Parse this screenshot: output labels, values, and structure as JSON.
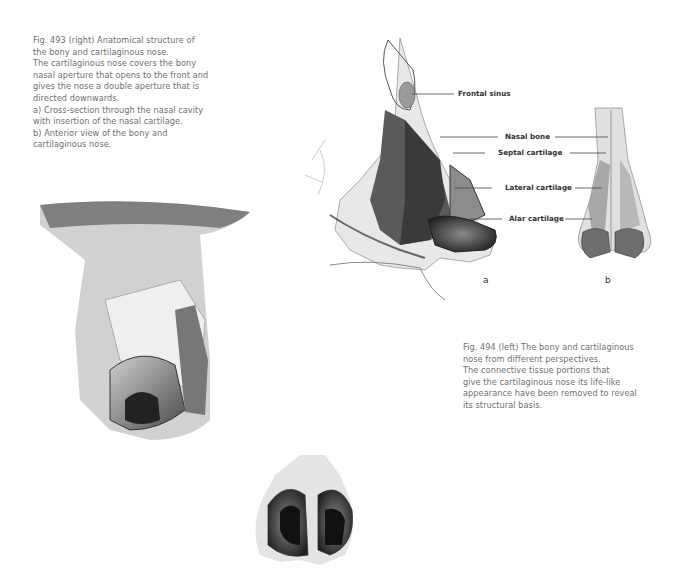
{
  "fig493": {
    "lines": [
      "Fig. 493 (right)  Anatomical structure of",
      "the bony and cartilaginous nose.",
      "The cartilaginous nose covers the bony",
      "nasal aperture that opens to the front and",
      "gives the nose a double aperture that is",
      "directed downwards.",
      "a)  Cross-section through the nasal cavity",
      "with insertion of the nasal cartilage.",
      "b)  Anterior view of the bony and",
      "cartilaginous nose."
    ]
  },
  "fig494": {
    "lines": [
      "Fig. 494 (left)  The bony and cartilaginous",
      "nose from different perspectives.",
      "The connective tissue portions that",
      "give the cartilaginous nose its life-like",
      "appearance have been removed to reveal",
      "its structural basis."
    ]
  },
  "labels": {
    "frontal_sinus": "Frontal sinus",
    "nasal_bone": "Nasal bone",
    "septal_cartilage": "Septal cartilage",
    "lateral_cartilage": "Lateral cartilage",
    "alar_cartilage": "Alar cartilage"
  },
  "sublabels": {
    "a": "a",
    "b": "b"
  }
}
